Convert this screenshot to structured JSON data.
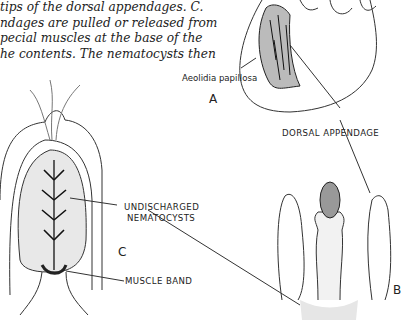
{
  "caption": {
    "lines": [
      "tips of the dorsal appendages. C.",
      "ndages are pulled or released from",
      "pecial muscles at the base of the",
      "he contents. The nematocysts then"
    ]
  },
  "figure": {
    "species_label": "Aeolidia papillosa",
    "panel_a": "A",
    "panel_b": "B",
    "panel_c": "C",
    "labels": {
      "dorsal_appendage": "DORSAL APPENDAGE",
      "undischarged_line1": "UNDISCHARGED",
      "undischarged_line2": "NEMATOCYSTS",
      "muscle_band": "MUSCLE BAND"
    }
  }
}
